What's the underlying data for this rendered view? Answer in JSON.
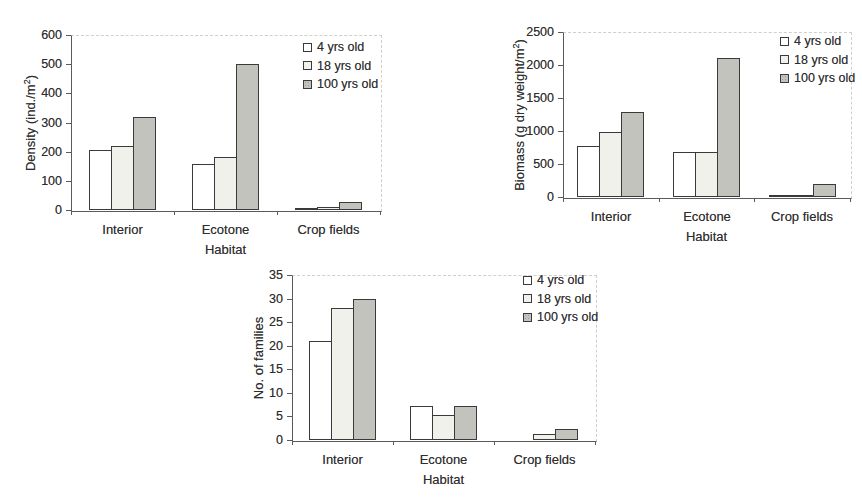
{
  "figure": {
    "background": "#ffffff"
  },
  "colors": {
    "axis": "#5a5a5a",
    "bar_border": "#3a3a3a",
    "text": "#2e2e2e",
    "plot_dotted_border": "#cfcfcb",
    "fill_4_yrs": "#ffffff",
    "fill_18_yrs": "#f1f1ec",
    "fill_100_yrs": "#c3c3be"
  },
  "legend_labels": [
    "4 yrs old",
    "18 yrs old",
    "100 yrs old"
  ],
  "chart_data": [
    {
      "id": "density",
      "type": "bar",
      "title": "",
      "xlabel": "Habitat",
      "ylabel": "Density (ind./m²)",
      "ylabel_parts": {
        "pre": "Density (ind./m",
        "sup": "2",
        "post": ")"
      },
      "categories": [
        "Interior",
        "Ecotone",
        "Crop fields"
      ],
      "ylim": [
        0,
        600
      ],
      "yticks": [
        0,
        100,
        200,
        300,
        400,
        500,
        600
      ],
      "grid": false,
      "legend_position": "top-right",
      "series": [
        {
          "name": "4 yrs old",
          "values": [
            205,
            158,
            5
          ]
        },
        {
          "name": "18 yrs old",
          "values": [
            220,
            180,
            11
          ]
        },
        {
          "name": "100 yrs old",
          "values": [
            320,
            500,
            27
          ]
        }
      ]
    },
    {
      "id": "biomass",
      "type": "bar",
      "title": "",
      "xlabel": "Habitat",
      "ylabel": "Biomass (g dry weight/m²)",
      "ylabel_parts": {
        "pre": "Biomass (g dry weight/m",
        "sup": "2",
        "post": ")"
      },
      "categories": [
        "Interior",
        "Ecotone",
        "Crop fields"
      ],
      "ylim": [
        0,
        2500
      ],
      "yticks": [
        0,
        500,
        1000,
        1500,
        2000,
        2500
      ],
      "grid": false,
      "legend_position": "top-right",
      "series": [
        {
          "name": "4 yrs old",
          "values": [
            770,
            680,
            20
          ]
        },
        {
          "name": "18 yrs old",
          "values": [
            980,
            680,
            35
          ]
        },
        {
          "name": "100 yrs old",
          "values": [
            1290,
            2100,
            200
          ]
        }
      ]
    },
    {
      "id": "families",
      "type": "bar",
      "title": "",
      "xlabel": "Habitat",
      "ylabel": "No. of families",
      "ylabel_parts": {
        "pre": "No. of families",
        "sup": "",
        "post": ""
      },
      "categories": [
        "Interior",
        "Ecotone",
        "Crop fields"
      ],
      "ylim": [
        0,
        35
      ],
      "yticks": [
        0,
        5,
        10,
        15,
        20,
        25,
        30,
        35
      ],
      "grid": false,
      "legend_position": "top-right",
      "series": [
        {
          "name": "4 yrs old",
          "values": [
            21,
            7.2,
            0
          ]
        },
        {
          "name": "18 yrs old",
          "values": [
            28,
            5.2,
            1.3
          ]
        },
        {
          "name": "100 yrs old",
          "values": [
            30,
            7.2,
            2.3
          ]
        }
      ]
    }
  ]
}
